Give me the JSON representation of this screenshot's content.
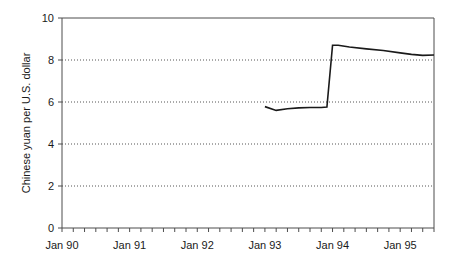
{
  "chart_data": {
    "type": "line",
    "title": "",
    "xlabel": "",
    "ylabel": "Chinese yuan per U.S. dollar",
    "ylim": [
      0,
      10
    ],
    "xlim": [
      "Jan 90",
      "Jul 95"
    ],
    "grid": "horizontal-dotted",
    "legend": "none",
    "y_ticks": [
      0,
      2,
      4,
      6,
      8,
      10
    ],
    "y_tick_labels": [
      "0",
      "2",
      "4",
      "6",
      "8",
      "10"
    ],
    "gridline_values": [
      2,
      4,
      6,
      8
    ],
    "x_tick_labels": [
      "Jan 90",
      "Jan 91",
      "Jan 92",
      "Jan 93",
      "Jan 94",
      "Jan 95"
    ],
    "x_tick_positions_months": [
      0,
      12,
      24,
      36,
      48,
      60
    ],
    "x_minor_tick_interval_months": 2,
    "x_axis_total_months": 66,
    "series": [
      {
        "name": "Chinese yuan per U.S. dollar",
        "color": "#1a1a1a",
        "x_months": [
          36,
          38,
          40,
          42,
          44,
          46,
          47,
          48,
          49,
          51,
          54,
          57,
          60,
          62,
          64,
          66
        ],
        "x_labels": [
          "Jan 93",
          "Mar 93",
          "May 93",
          "Jul 93",
          "Sep 93",
          "Nov 93",
          "Dec 93",
          "Jan 94",
          "Feb 94",
          "Apr 94",
          "Jul 94",
          "Oct 94",
          "Jan 95",
          "Mar 95",
          "May 95",
          "Jul 95"
        ],
        "values": [
          5.78,
          5.6,
          5.68,
          5.72,
          5.74,
          5.74,
          5.76,
          8.7,
          8.7,
          8.62,
          8.53,
          8.45,
          8.34,
          8.27,
          8.22,
          8.24
        ]
      }
    ]
  }
}
